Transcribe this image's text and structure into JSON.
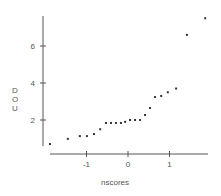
{
  "chart_data": {
    "type": "scatter",
    "title": "",
    "xlabel": "nscores",
    "ylabel": "DOU",
    "xlim": [
      -2,
      2
    ],
    "ylim": [
      0.5,
      7.7
    ],
    "x_ticks": [
      -1,
      0,
      1
    ],
    "x_tick_labels": [
      "-1",
      "0",
      "1"
    ],
    "y_ticks": [
      2,
      4,
      6
    ],
    "y_tick_labels": [
      "2",
      "4",
      "6"
    ],
    "grid": false,
    "legend": null,
    "points": [
      {
        "x": -1.88,
        "y": 0.7
      },
      {
        "x": -1.45,
        "y": 0.98
      },
      {
        "x": -1.16,
        "y": 1.13
      },
      {
        "x": -0.99,
        "y": 1.13
      },
      {
        "x": -0.82,
        "y": 1.24
      },
      {
        "x": -0.67,
        "y": 1.5
      },
      {
        "x": -0.53,
        "y": 1.84
      },
      {
        "x": -0.41,
        "y": 1.84
      },
      {
        "x": -0.29,
        "y": 1.84
      },
      {
        "x": -0.17,
        "y": 1.84
      },
      {
        "x": -0.07,
        "y": 1.9
      },
      {
        "x": 0.05,
        "y": 2.0
      },
      {
        "x": 0.17,
        "y": 2.0
      },
      {
        "x": 0.29,
        "y": 2.0
      },
      {
        "x": 0.41,
        "y": 2.27
      },
      {
        "x": 0.53,
        "y": 2.65
      },
      {
        "x": 0.65,
        "y": 3.24
      },
      {
        "x": 0.8,
        "y": 3.3
      },
      {
        "x": 0.96,
        "y": 3.5
      },
      {
        "x": 1.16,
        "y": 3.7
      },
      {
        "x": 1.42,
        "y": 6.6
      },
      {
        "x": 1.86,
        "y": 7.5
      }
    ]
  },
  "colors": {
    "axis": "#555555",
    "point": "#333333",
    "text": "#555555"
  }
}
